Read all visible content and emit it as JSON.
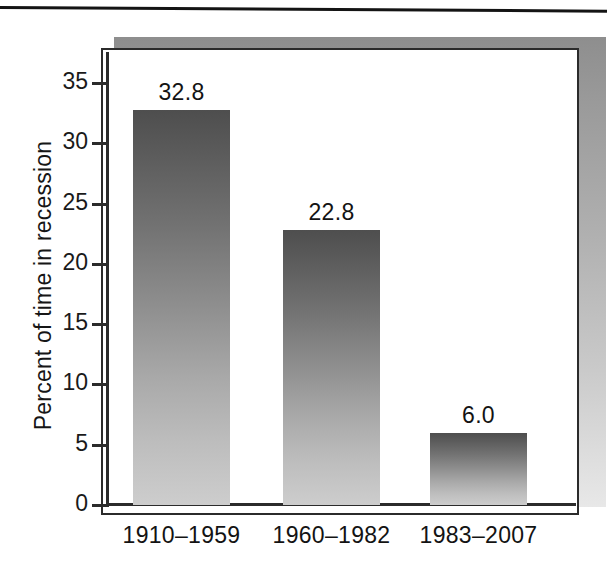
{
  "figure": {
    "background_color": "#ffffff",
    "panel_border_color": "#2b2b2b",
    "shadow_color_top": "#8e8e8e",
    "shadow_color_bottom": "#e8e8e8",
    "bar_color_top": "#4e4e4e",
    "bar_color_bottom": "#cdcdcd",
    "text_color": "#131313"
  },
  "chart_data": {
    "type": "bar",
    "title": "",
    "xlabel": "",
    "ylabel": "Percent of time in recession",
    "categories": [
      "1910–1959",
      "1960–1982",
      "1983–2007"
    ],
    "values": [
      32.8,
      22.8,
      6.0
    ],
    "value_labels": [
      "32.8",
      "22.8",
      "6.0"
    ],
    "ylim": [
      0,
      37.5
    ],
    "yticks": [
      0,
      5,
      10,
      15,
      20,
      25,
      30,
      35
    ],
    "ytick_labels": [
      "0",
      "5",
      "10",
      "15",
      "20",
      "25",
      "30",
      "35"
    ],
    "grid": false,
    "legend": null
  }
}
